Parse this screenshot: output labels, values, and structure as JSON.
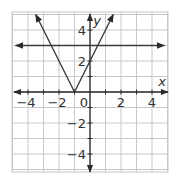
{
  "chart_data": {
    "type": "line",
    "title": "",
    "xlabel": "x",
    "ylabel": "y",
    "xlim": [
      -5,
      5
    ],
    "ylim": [
      -5,
      5
    ],
    "grid": true,
    "x_ticks": [
      -4,
      -2,
      0,
      2,
      4
    ],
    "y_ticks": [
      -4,
      -2,
      2,
      4
    ],
    "x_tick_labels": [
      "−4",
      "−2",
      "0",
      "2",
      "4"
    ],
    "y_tick_labels": [
      "−4",
      "−2",
      "2",
      "4"
    ],
    "origin_label": "0",
    "series": [
      {
        "name": "y = 2|x + 1|",
        "kind": "absolute-value",
        "vertex": [
          -1,
          0
        ],
        "points": [
          [
            -3.5,
            5
          ],
          [
            -1,
            0
          ],
          [
            1.5,
            5
          ]
        ]
      },
      {
        "name": "y = 3",
        "kind": "horizontal-line",
        "points": [
          [
            -4.8,
            3
          ],
          [
            4.8,
            3
          ]
        ]
      }
    ]
  },
  "colors": {
    "grid": "#c8c8c8",
    "axis": "#2a2a2a",
    "line": "#3a3a3a",
    "text": "#333333"
  }
}
